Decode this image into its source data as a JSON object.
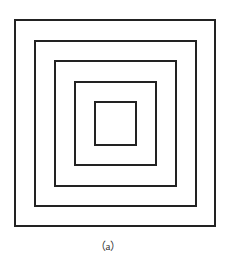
{
  "figure": {
    "caption": "（a）",
    "stroke_color": "#222222",
    "squares": [
      {
        "left": 14,
        "top": 19,
        "width": 202,
        "height": 208
      },
      {
        "left": 34,
        "top": 40,
        "width": 163,
        "height": 167
      },
      {
        "left": 54,
        "top": 60,
        "width": 123,
        "height": 127
      },
      {
        "left": 74,
        "top": 81,
        "width": 83,
        "height": 85
      },
      {
        "left": 94,
        "top": 101,
        "width": 43,
        "height": 45
      }
    ]
  }
}
